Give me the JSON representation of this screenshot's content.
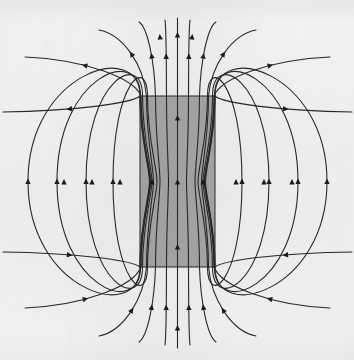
{
  "figure": {
    "caption": "",
    "alt_text": "Field lines run upward inside a gray rectangular magnet, exit the top face, loop around the outside, and re-enter the bottom face.",
    "canvas": {
      "width": 354,
      "height": 360
    },
    "background_color": "#f5f4f2",
    "media": "scanned print, grayscale"
  },
  "magnet": {
    "label": "magnetized-bar",
    "shape": "rectangle",
    "fill_color": "#a9a9a9",
    "stroke_color": "#2b2b2b",
    "stroke_width": 1.0,
    "x": 140,
    "y": 96,
    "width": 75,
    "height": 171,
    "top_face_y": 96,
    "bottom_face_y": 267,
    "left_face_x": 140,
    "right_face_x": 215,
    "center_x": 177.5,
    "center_y": 181.5
  },
  "field": {
    "line_color": "#2a2a2a",
    "line_width": 1.1,
    "arrow_color": "#1d1d1d",
    "arrow_size": 5.2,
    "direction": "upward along the axis inside the magnet; returning downward outside",
    "interior_line_count": 7,
    "exterior_loop_count_per_side": 5,
    "open_line_count": 6,
    "symmetry": "mirror symmetric about the vertical axis x=177.5 and about the horizontal midline y=181.5"
  },
  "chart_data": {
    "type": "line",
    "xlabel": "",
    "ylabel": "",
    "xlim": [
      0,
      354
    ],
    "ylim": [
      0,
      360
    ],
    "grid": false,
    "legend": "none",
    "axis_x": 177.5,
    "midline_y": 181.5,
    "interior_offsets": [
      0,
      12,
      24,
      35,
      37
    ],
    "series": [
      {
        "name": "axis-line",
        "kind": "open",
        "half_offset": 0,
        "waist_pinch": 0,
        "exit_spread": 0,
        "top_end": [
          177.5,
          18
        ],
        "bottom_end": [
          177.5,
          348
        ]
      },
      {
        "name": "interior-line-1",
        "kind": "open",
        "half_offset": 11,
        "waist_pinch": 2.0,
        "exit_spread": 13,
        "top_end": [
          190,
          20
        ],
        "bottom_end": [
          190,
          345
        ]
      },
      {
        "name": "interior-line-2",
        "kind": "open",
        "half_offset": 22,
        "waist_pinch": 4.5,
        "exit_spread": 34,
        "top_end": [
          216,
          22
        ],
        "bottom_end": [
          216,
          342
        ]
      },
      {
        "name": "interior-line-3",
        "kind": "open",
        "half_offset": 31,
        "waist_pinch": 7.0,
        "exit_spread": 66,
        "top_end": [
          256,
          30
        ],
        "bottom_end": [
          256,
          336
        ]
      },
      {
        "name": "edge-line-open",
        "kind": "open",
        "half_offset": 36.5,
        "waist_pinch": 9.5,
        "exit_spread": 118,
        "top_end": [
          330,
          57
        ],
        "bottom_end": [
          330,
          308
        ]
      },
      {
        "name": "corner-line-open",
        "kind": "open",
        "half_offset": 37.5,
        "waist_pinch": 10.5,
        "exit_spread": 160,
        "top_end": [
          352,
          112
        ],
        "bottom_end": [
          352,
          252
        ]
      },
      {
        "name": "loop-1",
        "kind": "closed",
        "bulge_x_left": 113,
        "bulge_x_right": 242,
        "entry_offset": 30
      },
      {
        "name": "loop-2",
        "kind": "closed",
        "bulge_x_left": 86,
        "bulge_x_right": 269,
        "entry_offset": 35
      },
      {
        "name": "loop-3",
        "kind": "closed",
        "bulge_x_left": 57,
        "bulge_x_right": 298,
        "entry_offset": 37
      },
      {
        "name": "loop-4",
        "kind": "closed",
        "bulge_x_left": 28,
        "bulge_x_right": 327,
        "entry_offset": 37.5
      }
    ],
    "arrowheads": [
      {
        "x": 177.5,
        "y": 35,
        "angle": -90,
        "region": "above-magnet"
      },
      {
        "x": 177.5,
        "y": 118,
        "angle": -90,
        "region": "inside-magnet"
      },
      {
        "x": 177.5,
        "y": 182,
        "angle": -90,
        "region": "inside-magnet"
      },
      {
        "x": 177.5,
        "y": 247,
        "angle": -90,
        "region": "inside-magnet"
      },
      {
        "x": 177.5,
        "y": 328,
        "angle": -90,
        "region": "below-magnet"
      },
      {
        "x": 192,
        "y": 37,
        "angle": -84,
        "region": "above-magnet"
      },
      {
        "x": 160,
        "y": 37,
        "angle": -96,
        "region": "above-magnet"
      },
      {
        "x": 152,
        "y": 182,
        "angle": -90,
        "region": "inside-magnet"
      },
      {
        "x": 203,
        "y": 182,
        "angle": -90,
        "region": "inside-magnet"
      },
      {
        "x": 120,
        "y": 182,
        "angle": -90,
        "region": "outside-left"
      },
      {
        "x": 92,
        "y": 182,
        "angle": -90,
        "region": "outside-left"
      },
      {
        "x": 64,
        "y": 182,
        "angle": -90,
        "region": "outside-left"
      },
      {
        "x": 236,
        "y": 182,
        "angle": -90,
        "region": "outside-right"
      },
      {
        "x": 264,
        "y": 182,
        "angle": -90,
        "region": "outside-right"
      },
      {
        "x": 292,
        "y": 182,
        "angle": -90,
        "region": "outside-right"
      }
    ]
  }
}
